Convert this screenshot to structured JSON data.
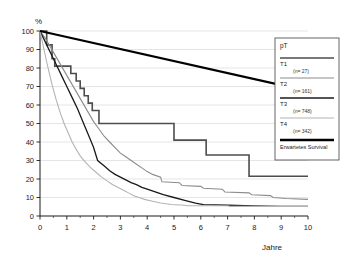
{
  "chart_data": {
    "type": "line",
    "title": "",
    "xlabel": "Jahre",
    "ylabel": "%",
    "xlim": [
      0,
      10
    ],
    "ylim": [
      0,
      100
    ],
    "xticks": [
      "0",
      "1",
      "2",
      "3",
      "4",
      "5",
      "6",
      "7",
      "8",
      "9",
      "10"
    ],
    "yticks": [
      "0",
      "10",
      "20",
      "30",
      "40",
      "50",
      "60",
      "70",
      "80",
      "90",
      "100"
    ],
    "grid": "horizontal",
    "legend_position": "right",
    "step_style": "post",
    "series": [
      {
        "name": "T1",
        "n_label": "(n= 27)",
        "color": "#4d4d4d",
        "width": 1.6,
        "points": [
          [
            0,
            100
          ],
          [
            0.25,
            100
          ],
          [
            0.25,
            92.5
          ],
          [
            0.45,
            92.5
          ],
          [
            0.45,
            85
          ],
          [
            0.55,
            85
          ],
          [
            0.55,
            81
          ],
          [
            1.15,
            81
          ],
          [
            1.15,
            77
          ],
          [
            1.35,
            77
          ],
          [
            1.35,
            73
          ],
          [
            1.5,
            73
          ],
          [
            1.5,
            69
          ],
          [
            1.65,
            69
          ],
          [
            1.65,
            65
          ],
          [
            1.8,
            65
          ],
          [
            1.8,
            61
          ],
          [
            1.95,
            61
          ],
          [
            1.95,
            57
          ],
          [
            2.2,
            57
          ],
          [
            2.2,
            50
          ],
          [
            5.0,
            50
          ],
          [
            5.0,
            41
          ],
          [
            6.2,
            41
          ],
          [
            6.2,
            33
          ],
          [
            7.8,
            33
          ],
          [
            7.8,
            21.5
          ],
          [
            10,
            21.5
          ]
        ]
      },
      {
        "name": "T2",
        "n_label": "(n= 161)",
        "color": "#8c8c8c",
        "width": 1.1,
        "points": [
          [
            0,
            100
          ],
          [
            0.2,
            96
          ],
          [
            0.4,
            91
          ],
          [
            0.6,
            86
          ],
          [
            0.8,
            81
          ],
          [
            1.0,
            76
          ],
          [
            1.2,
            71
          ],
          [
            1.4,
            66
          ],
          [
            1.6,
            61
          ],
          [
            1.8,
            56
          ],
          [
            2.0,
            51
          ],
          [
            2.2,
            47
          ],
          [
            2.4,
            43
          ],
          [
            2.6,
            40
          ],
          [
            2.8,
            37
          ],
          [
            3.0,
            34
          ],
          [
            3.2,
            32
          ],
          [
            3.4,
            30
          ],
          [
            3.6,
            28
          ],
          [
            3.8,
            26
          ],
          [
            4.0,
            24
          ],
          [
            4.2,
            22.5
          ],
          [
            4.5,
            21
          ],
          [
            4.55,
            18.5
          ],
          [
            5.2,
            18
          ],
          [
            5.3,
            16.5
          ],
          [
            6.0,
            16
          ],
          [
            6.1,
            15
          ],
          [
            6.8,
            14.5
          ],
          [
            6.9,
            13
          ],
          [
            7.8,
            12.5
          ],
          [
            7.9,
            11.5
          ],
          [
            8.6,
            11
          ],
          [
            8.7,
            10
          ],
          [
            9.2,
            9.5
          ],
          [
            10,
            9
          ]
        ]
      },
      {
        "name": "T3",
        "n_label": "(n= 748)",
        "color": "#1a1a1a",
        "width": 1.3,
        "points": [
          [
            0,
            100
          ],
          [
            0.2,
            94
          ],
          [
            0.4,
            88
          ],
          [
            0.6,
            82
          ],
          [
            0.8,
            76
          ],
          [
            1.0,
            70
          ],
          [
            1.2,
            64
          ],
          [
            1.4,
            58
          ],
          [
            1.6,
            51
          ],
          [
            1.8,
            44
          ],
          [
            2.0,
            37
          ],
          [
            2.15,
            30
          ],
          [
            2.4,
            27
          ],
          [
            2.6,
            24.5
          ],
          [
            2.8,
            22.5
          ],
          [
            3.0,
            21
          ],
          [
            3.2,
            19.5
          ],
          [
            3.4,
            18
          ],
          [
            3.6,
            17
          ],
          [
            3.8,
            15.5
          ],
          [
            4.0,
            14.5
          ],
          [
            4.3,
            13
          ],
          [
            4.6,
            11.5
          ],
          [
            5.0,
            10
          ],
          [
            5.4,
            8.5
          ],
          [
            5.8,
            7
          ],
          [
            6.1,
            6.2
          ],
          [
            6.5,
            6
          ],
          [
            7.0,
            5.8
          ],
          [
            8.0,
            5.5
          ],
          [
            9.0,
            5.2
          ],
          [
            10,
            5.2
          ]
        ]
      },
      {
        "name": "T4",
        "n_label": "(n= 342)",
        "color": "#b3b3b3",
        "width": 1.1,
        "points": [
          [
            0,
            100
          ],
          [
            0.15,
            90
          ],
          [
            0.3,
            80
          ],
          [
            0.45,
            71
          ],
          [
            0.6,
            63
          ],
          [
            0.75,
            56
          ],
          [
            0.9,
            50
          ],
          [
            1.05,
            45
          ],
          [
            1.2,
            40
          ],
          [
            1.35,
            36
          ],
          [
            1.5,
            32.5
          ],
          [
            1.7,
            29
          ],
          [
            1.9,
            26
          ],
          [
            2.1,
            23.5
          ],
          [
            2.3,
            21
          ],
          [
            2.5,
            19
          ],
          [
            2.7,
            17
          ],
          [
            2.9,
            15.5
          ],
          [
            3.1,
            14
          ],
          [
            3.3,
            12.5
          ],
          [
            3.5,
            11
          ],
          [
            3.7,
            10
          ],
          [
            3.9,
            9
          ],
          [
            4.2,
            8
          ],
          [
            4.5,
            7
          ],
          [
            4.9,
            6.2
          ],
          [
            5.4,
            5.8
          ],
          [
            5.5,
            5.5
          ],
          [
            7.0,
            5.5
          ],
          [
            7.1,
            5.2
          ],
          [
            10,
            5.2
          ]
        ]
      },
      {
        "name": "Erwartetes Survival",
        "n_label": "",
        "color": "#000000",
        "width": 2.2,
        "points": [
          [
            0,
            100
          ],
          [
            10,
            67.5
          ]
        ]
      }
    ]
  },
  "legend": {
    "title": "pT",
    "entries": [
      {
        "label": "T1",
        "n_label": "(n= 27)"
      },
      {
        "label": "T2",
        "n_label": "(n= 161)"
      },
      {
        "label": "T3",
        "n_label": "(n= 748)"
      },
      {
        "label": "T4",
        "n_label": "(n= 342)"
      },
      {
        "label": "Erwartetes Survival",
        "n_label": ""
      }
    ]
  },
  "colors": {
    "background": "#ffffff",
    "axis": "#1a1a1a",
    "grid": "#c8c8d2",
    "border": "#555555"
  }
}
